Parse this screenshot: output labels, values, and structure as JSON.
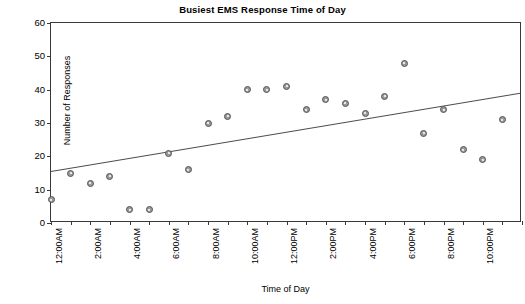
{
  "chart_data": {
    "type": "scatter",
    "title": "Busiest EMS Response Time of Day",
    "xlabel": "Time of Day",
    "ylabel": "Number of Responses",
    "grid": false,
    "legend": false,
    "ylim": [
      0,
      60
    ],
    "yticks": [
      0,
      10,
      20,
      30,
      40,
      50,
      60
    ],
    "xlim": [
      0,
      24
    ],
    "xtick_labels": [
      "12:00AM",
      "2:00AM",
      "4:00AM",
      "6:00AM",
      "8:00AM",
      "10:00AM",
      "12:00PM",
      "2:00PM",
      "4:00PM",
      "6:00PM",
      "8:00PM",
      "10:00PM"
    ],
    "xtick_values": [
      0,
      2,
      4,
      6,
      8,
      10,
      12,
      14,
      16,
      18,
      20,
      22
    ],
    "x": [
      0,
      1,
      2,
      3,
      4,
      5,
      6,
      7,
      8,
      9,
      10,
      11,
      12,
      13,
      14,
      15,
      16,
      17,
      18,
      19,
      20,
      21,
      22,
      23
    ],
    "values": [
      7,
      15,
      12,
      14,
      4,
      4,
      21,
      16,
      30,
      32,
      40,
      40,
      41,
      34,
      37,
      36,
      33,
      38,
      48,
      27,
      34,
      22,
      19,
      31
    ],
    "point_color": "#9a9a9a",
    "point_edge_color": "#555555",
    "trendline": {
      "show": true,
      "color": "#4a4a4a",
      "x": [
        0,
        24
      ],
      "y": [
        15,
        38.7
      ]
    }
  }
}
